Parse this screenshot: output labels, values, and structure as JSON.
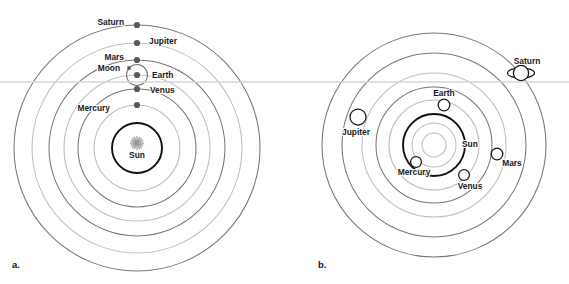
{
  "figure": {
    "width": 569,
    "height": 284,
    "background": "#ffffff",
    "horizon_line": {
      "y": 82,
      "color": "#d6d6d8"
    }
  },
  "colors": {
    "orbit_dark": "#77777a",
    "orbit_light": "#bdbdc0",
    "sun_orbit": "#101010",
    "body_fill": "#59595c",
    "open_body_fill": "#ffffff",
    "label_text": "#1a1a1a",
    "sun_glyph": "#9a9a9d"
  },
  "panels": [
    {
      "id": "a",
      "caption": "a.",
      "caption_pos": {
        "x": 12,
        "y": 268
      },
      "model": "geocentric-style stacked orbits",
      "center": {
        "x": 137,
        "y": 148
      },
      "sun": {
        "label": "Sun",
        "label_pos": {
          "x": 137,
          "y": 158
        },
        "glyph": "starburst-icon",
        "glyph_pos": {
          "x": 137,
          "y": 143
        },
        "circle_r": 25
      },
      "orbits": [
        {
          "name": "mercury-orbit",
          "rx": 43,
          "ry": 43,
          "tone": "light"
        },
        {
          "name": "venus-orbit",
          "rx": 59,
          "ry": 59,
          "tone": "dark"
        },
        {
          "name": "earth-orbit",
          "rx": 73,
          "ry": 73,
          "tone": "light"
        },
        {
          "name": "mars-orbit",
          "rx": 88,
          "ry": 88,
          "tone": "dark"
        },
        {
          "name": "jupiter-orbit",
          "rx": 105,
          "ry": 105,
          "tone": "light"
        },
        {
          "name": "saturn-orbit",
          "rx": 123,
          "ry": 123,
          "tone": "dark"
        }
      ],
      "bodies": [
        {
          "name": "mercury",
          "label": "Mercury",
          "cx": 137,
          "cy": 105,
          "r": 3.1,
          "style": "dot",
          "label_pos": {
            "x": 110,
            "y": 111
          },
          "anchor": "end"
        },
        {
          "name": "venus",
          "label": "Venus",
          "cx": 137,
          "cy": 89,
          "r": 3.1,
          "style": "dot",
          "label_pos": {
            "x": 150,
            "y": 93
          },
          "anchor": "start"
        },
        {
          "name": "earth",
          "label": "Earth",
          "cx": 137,
          "cy": 75,
          "r": 3.1,
          "style": "dot",
          "label_pos": {
            "x": 152,
            "y": 78
          },
          "anchor": "start"
        },
        {
          "name": "mars",
          "label": "Mars",
          "cx": 137,
          "cy": 60,
          "r": 3.1,
          "style": "dot",
          "label_pos": {
            "x": 124,
            "y": 60
          },
          "anchor": "end"
        },
        {
          "name": "jupiter",
          "label": "Jupiter",
          "cx": 137,
          "cy": 43,
          "r": 3.1,
          "style": "dot",
          "label_pos": {
            "x": 149,
            "y": 44
          },
          "anchor": "start"
        },
        {
          "name": "saturn",
          "label": "Saturn",
          "cx": 137,
          "cy": 25,
          "r": 3.1,
          "style": "dot",
          "label_pos": {
            "x": 124,
            "y": 25
          },
          "anchor": "end"
        }
      ],
      "moon": {
        "label": "Moon",
        "label_pos": {
          "x": 120,
          "y": 71
        },
        "anchor": "end",
        "marker": {
          "cx": 129,
          "cy": 68,
          "size": 3.4
        },
        "orbit": {
          "cx": 137,
          "cy": 75,
          "r": 10.5
        }
      }
    },
    {
      "id": "b",
      "caption": "b.",
      "caption_pos": {
        "x": 318,
        "y": 268
      },
      "model": "heliocentric scattered planets",
      "center": {
        "x": 434,
        "y": 145
      },
      "sun": {
        "label": "Sun",
        "label_pos": {
          "x": 462,
          "y": 147
        },
        "anchor": "start",
        "glyph": "plain-circle-icon",
        "core_r": 12,
        "halo_r": 22,
        "circle_r": 31
      },
      "orbits": [
        {
          "name": "mercury-orbit",
          "rx": 31,
          "ry": 31,
          "tone": "sun"
        },
        {
          "name": "venus-orbit",
          "rx": 45,
          "ry": 45,
          "tone": "light"
        },
        {
          "name": "earth-orbit",
          "rx": 58,
          "ry": 58,
          "tone": "dark"
        },
        {
          "name": "mars-orbit",
          "rx": 72,
          "ry": 72,
          "tone": "light"
        },
        {
          "name": "jupiter-orbit",
          "rx": 92,
          "ry": 92,
          "tone": "dark"
        },
        {
          "name": "saturn-orbit",
          "rx": 112,
          "ry": 112,
          "tone": "dark"
        }
      ],
      "bodies": [
        {
          "name": "mercury",
          "label": "Mercury",
          "cx": 416,
          "cy": 162,
          "r": 5.4,
          "style": "open",
          "label_pos": {
            "x": 414,
            "y": 175
          },
          "anchor": "middle"
        },
        {
          "name": "venus",
          "label": "Venus",
          "cx": 464,
          "cy": 175,
          "r": 5.4,
          "style": "open",
          "label_pos": {
            "x": 470,
            "y": 189
          },
          "anchor": "middle"
        },
        {
          "name": "earth",
          "label": "Earth",
          "cx": 444,
          "cy": 105,
          "r": 5.8,
          "style": "open",
          "label_pos": {
            "x": 444,
            "y": 96
          },
          "anchor": "middle"
        },
        {
          "name": "mars",
          "label": "Mars",
          "cx": 497,
          "cy": 154,
          "r": 5.8,
          "style": "open",
          "label_pos": {
            "x": 512,
            "y": 166
          },
          "anchor": "middle"
        },
        {
          "name": "jupiter",
          "label": "Jupiter",
          "cx": 358,
          "cy": 117,
          "r": 8.0,
          "style": "open",
          "label_pos": {
            "x": 356,
            "y": 135
          },
          "anchor": "middle"
        },
        {
          "name": "saturn",
          "label": "Saturn",
          "cx": 521,
          "cy": 73,
          "r": 7.6,
          "style": "ringed",
          "label_pos": {
            "x": 527,
            "y": 64
          },
          "anchor": "middle",
          "ring": {
            "rx": 13.5,
            "ry": 5.2
          }
        }
      ]
    }
  ]
}
